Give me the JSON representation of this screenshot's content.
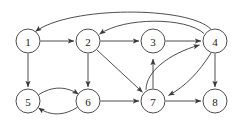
{
  "figure": {
    "type": "directed-graph",
    "width": 241,
    "height": 122,
    "background_color": "#ffffff",
    "stroke_color": "#3a3a3a",
    "label_color": "#1a1a1a"
  },
  "graph_data": {
    "directed": true,
    "node_count": 8,
    "edge_count": 16,
    "nodes": [
      {
        "id": "1",
        "label": "1",
        "x": 28,
        "y": 41,
        "r": 12
      },
      {
        "id": "2",
        "label": "2",
        "x": 88,
        "y": 41,
        "r": 12
      },
      {
        "id": "3",
        "label": "3",
        "x": 153,
        "y": 41,
        "r": 12
      },
      {
        "id": "4",
        "label": "4",
        "x": 215,
        "y": 41,
        "r": 12
      },
      {
        "id": "5",
        "label": "5",
        "x": 28,
        "y": 101,
        "r": 12
      },
      {
        "id": "6",
        "label": "6",
        "x": 88,
        "y": 101,
        "r": 12
      },
      {
        "id": "7",
        "label": "7",
        "x": 153,
        "y": 101,
        "r": 12
      },
      {
        "id": "8",
        "label": "8",
        "x": 215,
        "y": 101,
        "r": 12
      }
    ],
    "edges": [
      {
        "from": "1",
        "to": "2",
        "style": "straight"
      },
      {
        "from": "1",
        "to": "5",
        "style": "straight"
      },
      {
        "from": "2",
        "to": "3",
        "style": "straight"
      },
      {
        "from": "2",
        "to": "6",
        "style": "straight"
      },
      {
        "from": "2",
        "to": "7",
        "style": "straight"
      },
      {
        "from": "3",
        "to": "4",
        "style": "straight"
      },
      {
        "from": "4",
        "to": "1",
        "style": "arc-over-top-outer"
      },
      {
        "from": "4",
        "to": "2",
        "style": "arc-over-top-inner"
      },
      {
        "from": "4",
        "to": "7",
        "style": "curve-right"
      },
      {
        "from": "4",
        "to": "8",
        "style": "straight"
      },
      {
        "from": "5",
        "to": "6",
        "style": "curve-upper"
      },
      {
        "from": "6",
        "to": "5",
        "style": "curve-lower"
      },
      {
        "from": "6",
        "to": "7",
        "style": "straight"
      },
      {
        "from": "7",
        "to": "3",
        "style": "straight"
      },
      {
        "from": "7",
        "to": "4",
        "style": "curve-left"
      },
      {
        "from": "7",
        "to": "8",
        "style": "straight"
      }
    ]
  }
}
